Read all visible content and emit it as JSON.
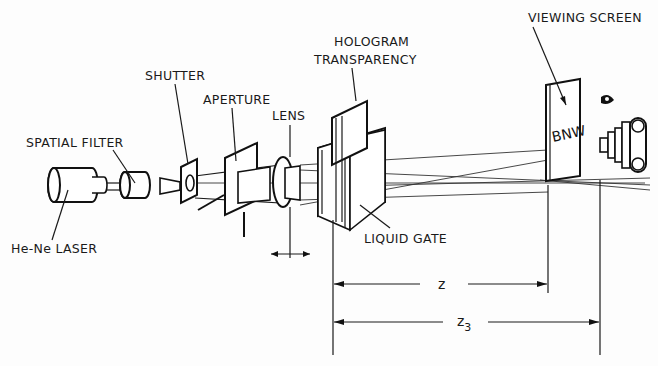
{
  "diagram": {
    "labels": {
      "laser": "He-Ne LASER",
      "spatial_filter": "SPATIAL FILTER",
      "shutter": "SHUTTER",
      "aperture": "APERTURE",
      "lens": "LENS",
      "hologram_line1": "HOLOGRAM",
      "hologram_line2": "TRANSPARENCY",
      "liquid_gate": "LIQUID GATE",
      "viewing_screen": "VIEWING SCREEN",
      "screen_text": "BNW"
    },
    "dimensions": {
      "z": "z",
      "z3_base": "z",
      "z3_sub": "3"
    },
    "icons": [
      "eye-icon",
      "camera-icon"
    ]
  }
}
